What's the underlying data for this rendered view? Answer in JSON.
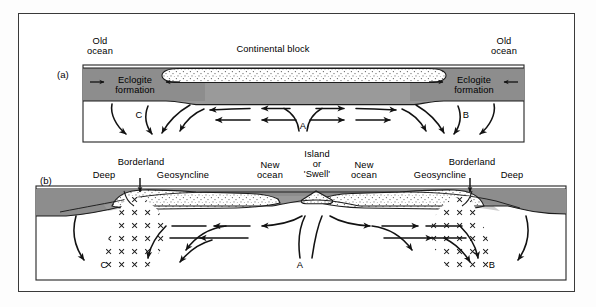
{
  "figure": {
    "title": "",
    "colors": {
      "mantle_dark_gray": "#8c8c8c",
      "mantle_mid_gray": "#9e9e9e",
      "sediment_stipple": "#ffffff",
      "stipple_dot": "#6b6b6b",
      "line": "#1a1a1a",
      "frame": "#3a3a3a",
      "background": "#ffffff"
    },
    "panels": [
      {
        "tag": "(a)",
        "labels": [
          {
            "name": "old-ocean-left",
            "text": "Old\nocean",
            "x": 100,
            "y": 36
          },
          {
            "name": "continental-block",
            "text": "Continental block",
            "x": 273,
            "y": 46
          },
          {
            "name": "old-ocean-right",
            "text": "Old\nocean",
            "x": 504,
            "y": 36
          },
          {
            "name": "eclogite-formation-left",
            "text": "Eclogite\nformation",
            "x": 133,
            "y": 81
          },
          {
            "name": "eclogite-formation-right",
            "text": "Eclogite\nformation",
            "x": 472,
            "y": 81
          },
          {
            "name": "cell-label-c",
            "text": "C",
            "x": 139,
            "y": 116
          },
          {
            "name": "cell-label-a",
            "text": "A",
            "x": 303,
            "y": 127
          },
          {
            "name": "cell-label-b",
            "text": "B",
            "x": 466,
            "y": 116
          }
        ]
      },
      {
        "tag": "(b)",
        "labels": [
          {
            "name": "borderland-left",
            "text": "Borderland",
            "x": 139,
            "y": 160
          },
          {
            "name": "deep-left",
            "text": "Deep",
            "x": 105,
            "y": 173
          },
          {
            "name": "geosyncline-left",
            "text": "Geosyncline",
            "x": 172,
            "y": 173
          },
          {
            "name": "new-ocean-left",
            "text": "New\nocean",
            "x": 270,
            "y": 165
          },
          {
            "name": "island-or-swell",
            "text": "Island\nor\n'Swell'",
            "x": 316,
            "y": 158
          },
          {
            "name": "new-ocean-right",
            "text": "New\nocean",
            "x": 364,
            "y": 165
          },
          {
            "name": "borderland-right",
            "text": "Borderland",
            "x": 470,
            "y": 160
          },
          {
            "name": "geosyncline-right",
            "text": "Geosyncline",
            "x": 448,
            "y": 173
          },
          {
            "name": "deep-right",
            "text": "Deep",
            "x": 516,
            "y": 173
          },
          {
            "name": "cell-label-c2",
            "text": "C",
            "x": 104,
            "y": 266
          },
          {
            "name": "cell-label-a2",
            "text": "A",
            "x": 300,
            "y": 266
          },
          {
            "name": "cell-label-b2",
            "text": "B",
            "x": 492,
            "y": 266
          }
        ]
      }
    ]
  }
}
